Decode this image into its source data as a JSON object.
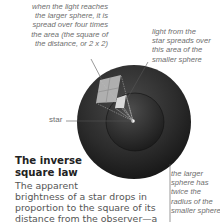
{
  "diagram": {
    "title": "The inverse square law",
    "heading_line1": "The inverse",
    "heading_line2": "square law",
    "body_lines": [
      "The apparent",
      "brightness of a star drops in",
      "proportion to the square of its",
      "distance from the observer—a",
      "rule called the inverse square"
    ],
    "labels": {
      "larger_sphere_area": [
        "when the light reaches",
        "the larger sphere, it is",
        "spread over four times",
        "the area (the square of",
        "the distance, or 2 x 2)"
      ],
      "smaller_sphere_area": [
        "light from the",
        "star spreads over",
        "this area of the",
        "smaller sphere"
      ],
      "radius": [
        "the larger",
        "sphere has",
        "twice the",
        "radius of the",
        "smaller sphere"
      ],
      "star": "star"
    },
    "colors": {
      "sphere_dark": "#1e1e1e",
      "sphere_mid": "#3a3a3a",
      "patch_light": "#cfcfcf",
      "text_gray": "#6e6e6e",
      "heading": "#222222"
    }
  }
}
